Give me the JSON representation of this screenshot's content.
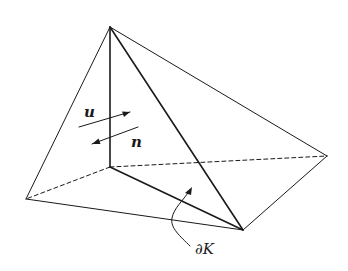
{
  "figure": {
    "type": "tetrahedron-element",
    "labels": {
      "u": "u",
      "n": "n",
      "boundary": "∂K"
    },
    "colors": {
      "stroke": "#1a1a1a",
      "background": "#ffffff"
    }
  }
}
